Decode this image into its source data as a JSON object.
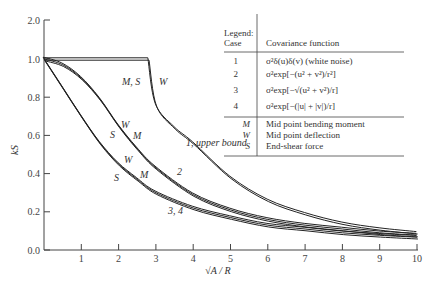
{
  "chart_data": {
    "type": "line",
    "title": "",
    "xlabel": "√A / R",
    "ylabel": "k_S",
    "xlim": [
      0,
      10
    ],
    "ylim": [
      0,
      2.0
    ],
    "x_ticks": [
      "1",
      "2",
      "3",
      "4",
      "5",
      "6",
      "7",
      "8",
      "9",
      "10"
    ],
    "y_ticks": [
      "0.0",
      "0.2",
      "0.4",
      "0.6",
      "0.8",
      "1.0",
      "2.0"
    ],
    "grid": false,
    "series": [
      {
        "name": "1, upper bound",
        "x": [
          0,
          2.8,
          3,
          3.5,
          4,
          5,
          6,
          7,
          8,
          9,
          10
        ],
        "y": [
          1.0,
          1.0,
          0.76,
          0.64,
          0.56,
          0.38,
          0.26,
          0.19,
          0.14,
          0.11,
          0.09
        ]
      },
      {
        "name": "2",
        "x": [
          0,
          0.5,
          1,
          1.5,
          2,
          2.5,
          3,
          4,
          5,
          6,
          7,
          8,
          9,
          10
        ],
        "y": [
          1.0,
          0.97,
          0.9,
          0.79,
          0.65,
          0.53,
          0.43,
          0.29,
          0.21,
          0.16,
          0.13,
          0.11,
          0.09,
          0.078
        ]
      },
      {
        "name": "3, 4",
        "x": [
          0,
          0.5,
          1,
          1.5,
          2,
          2.5,
          3,
          4,
          5,
          6,
          7,
          8,
          9,
          10
        ],
        "y": [
          1.0,
          0.85,
          0.7,
          0.56,
          0.45,
          0.37,
          0.3,
          0.22,
          0.17,
          0.13,
          0.11,
          0.09,
          0.077,
          0.067
        ]
      }
    ],
    "annotations": [
      "M, S",
      "W",
      "1, upper bound",
      "2",
      "3, 4",
      "W",
      "S",
      "M",
      "W",
      "S",
      "M"
    ],
    "legend": {
      "title": "Legend:",
      "case_header": "Case",
      "function_header": "Covariance function",
      "cases": [
        {
          "case": "1",
          "function": "σ²δ(u)δ(v) (white noise)"
        },
        {
          "case": "2",
          "function": "σ²exp[−(u² + v²)/r²]"
        },
        {
          "case": "3",
          "function": "σ²exp[−√(u² + v²)/r]"
        },
        {
          "case": "4",
          "function": "σ²exp[−(|u| + |v|)/r]"
        }
      ],
      "symbols": [
        {
          "symbol": "M",
          "meaning": "Mid point bending moment"
        },
        {
          "symbol": "W",
          "meaning": "Mid point deflection"
        },
        {
          "symbol": "S",
          "meaning": "End-shear force"
        }
      ]
    }
  }
}
